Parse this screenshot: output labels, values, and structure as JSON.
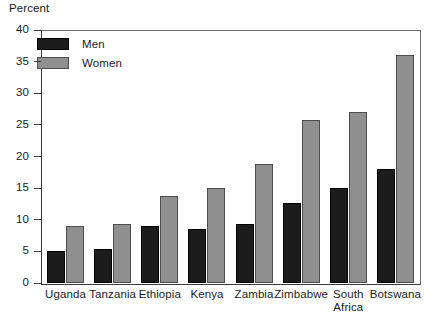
{
  "chart_data": {
    "type": "bar",
    "title": "",
    "xlabel": "",
    "ylabel": "Percent",
    "ylim": [
      0,
      40
    ],
    "yticks": [
      0,
      5,
      10,
      15,
      20,
      25,
      30,
      35,
      40
    ],
    "ytick_labels": [
      "0",
      "5",
      "10",
      "15",
      "20",
      "25",
      "30",
      "35",
      "40"
    ],
    "grid": false,
    "legend_position": "top-left",
    "categories": [
      "Uganda",
      "Tanzania",
      "Ethiopia",
      "Kenya",
      "Zambia",
      "Zimbabwe",
      "South\nAfrica",
      "Botswana"
    ],
    "series": [
      {
        "name": "Men",
        "color": "#1c1c1c",
        "values": [
          5.1,
          5.3,
          9.0,
          8.5,
          9.3,
          12.7,
          15.0,
          18.0
        ]
      },
      {
        "name": "Women",
        "color": "#8f8f8f",
        "values": [
          9.0,
          9.3,
          13.7,
          15.0,
          18.8,
          25.7,
          27.0,
          36.0
        ]
      }
    ]
  },
  "legend": {
    "items": [
      {
        "label": "Men",
        "swatch": "men"
      },
      {
        "label": "Women",
        "swatch": "women"
      }
    ]
  }
}
